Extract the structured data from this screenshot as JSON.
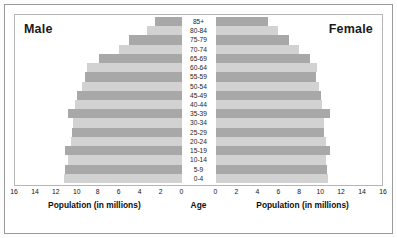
{
  "titles": {
    "left": "Male",
    "right": "Female"
  },
  "axis": {
    "center_label": "Age",
    "left_caption": "Population (in millions)",
    "right_caption": "Population (in millions)",
    "left_ticks": [
      "16",
      "14",
      "12",
      "10",
      "8",
      "6",
      "4",
      "2",
      "0"
    ],
    "right_ticks": [
      "0",
      "2",
      "4",
      "6",
      "8",
      "10",
      "12",
      "14",
      "16"
    ]
  },
  "colors": {
    "bar_light": "#d2d2d2",
    "bar_dark": "#a8a8a8",
    "frame": "#b5b5b5",
    "outer_frame": "#9a9a9a",
    "text": "#121212",
    "background": "#ffffff"
  },
  "chart_data": {
    "type": "bar",
    "title": "",
    "subtitle": "",
    "xlabel": "Population (in millions)",
    "ylabel": "Age",
    "xlim": [
      0,
      16
    ],
    "grid": false,
    "legend": [
      "Male",
      "Female"
    ],
    "orientation": "population-pyramid",
    "categories": [
      "85+",
      "80-84",
      "75-79",
      "70-74",
      "65-69",
      "60-64",
      "55-59",
      "50-54",
      "45-49",
      "40-44",
      "35-39",
      "30-34",
      "25-29",
      "20-24",
      "15-19",
      "10-14",
      "5-9",
      "0-4"
    ],
    "series": [
      {
        "name": "Male",
        "side": "left",
        "values": [
          2.5,
          3.3,
          5.0,
          6.0,
          7.9,
          9.1,
          9.3,
          9.6,
          10.0,
          10.2,
          10.9,
          10.4,
          10.5,
          10.6,
          11.2,
          10.9,
          11.2,
          11.3
        ]
      },
      {
        "name": "Female",
        "side": "right",
        "values": [
          5.0,
          6.0,
          7.1,
          8.0,
          9.1,
          9.8,
          9.7,
          9.9,
          10.1,
          10.2,
          11.0,
          10.4,
          10.4,
          10.6,
          11.0,
          10.6,
          10.7,
          10.8
        ]
      }
    ]
  }
}
